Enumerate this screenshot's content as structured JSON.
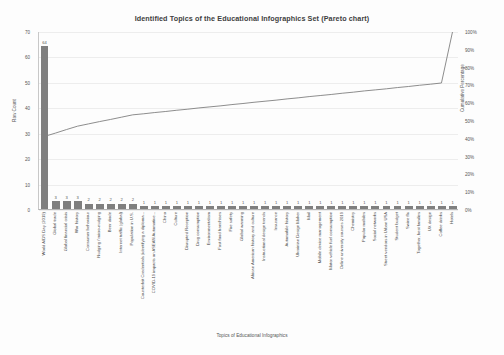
{
  "chart_data": {
    "type": "bar",
    "title": "Identified Topics of the Educational Infographics Set (Pareto chart)",
    "xlabel": "Topics of Educational Infographics",
    "ylabel": "Raw Count",
    "y2label": "Cumulative Percentage",
    "ylim": [
      0,
      70
    ],
    "y2lim": [
      0,
      100
    ],
    "grid": true,
    "legend": "none",
    "y_ticks": [
      "0",
      "10",
      "20",
      "30",
      "40",
      "50",
      "60",
      "70"
    ],
    "y2_ticks": [
      "0%",
      "10%",
      "20%",
      "30%",
      "40%",
      "50%",
      "60%",
      "70%",
      "80%",
      "90%",
      "100%"
    ],
    "bar_color": "#7f7f7f",
    "line_color": "#808080",
    "total_count": 156,
    "categories": [
      "World AIDS Day (2019)",
      "Global trade",
      "Global financial crisis",
      "War history",
      "Consumer behaviour",
      "Nudging / micro-nudging",
      "Beer diode",
      "Internet traffic (global)",
      "Population in U.S.",
      "Counterfeit Credentials (identifying a diploma...",
      "COVID-19 impacts on ASEAN Automotive...",
      "China",
      "Culture",
      "Disrupted Reception",
      "Drug consumption",
      "Environmentalism",
      "Fast food franchises",
      "Fire safety",
      "Global warming",
      "African American history and culture",
      "Instructional design trends",
      "Insurance",
      "Automobile history",
      "Ukrainian Design Maker",
      "Mail",
      "Mobile device management",
      "Motor vehicle fuel consumption",
      "Online university courses 2019",
      "Chemistry",
      "Popular mobiles",
      "Social networks",
      "Street vendors in Urban USA",
      "Student budget",
      "Swine flu",
      "Together, best families",
      "UX design",
      "Coffee drinks",
      "Hotels"
    ],
    "values": [
      64,
      3,
      3,
      3,
      2,
      2,
      2,
      2,
      2,
      1,
      1,
      1,
      1,
      1,
      1,
      1,
      1,
      1,
      1,
      1,
      1,
      1,
      1,
      1,
      1,
      1,
      1,
      1,
      1,
      1,
      1,
      1,
      1,
      1,
      1,
      1,
      1,
      1
    ],
    "cumulative_percentages": [
      41.0,
      42.9,
      44.9,
      46.8,
      48.1,
      49.4,
      50.6,
      51.9,
      53.2,
      53.8,
      54.5,
      55.1,
      55.8,
      56.4,
      57.1,
      57.7,
      58.3,
      59.0,
      59.6,
      60.3,
      60.9,
      61.5,
      62.2,
      62.8,
      63.5,
      64.1,
      64.7,
      65.4,
      66.0,
      66.7,
      67.3,
      67.9,
      68.6,
      69.2,
      69.9,
      70.5,
      71.2,
      100.0
    ]
  }
}
